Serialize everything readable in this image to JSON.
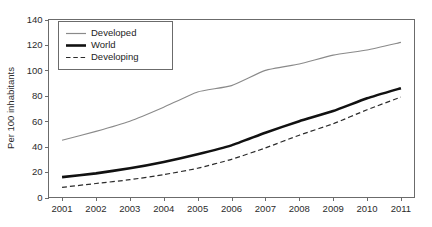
{
  "chart_data": {
    "type": "line",
    "title": "",
    "subtitle": "",
    "xlabel": "",
    "ylabel": "Per 100 inhabitants",
    "x": [
      2001,
      2002,
      2003,
      2004,
      2005,
      2006,
      2007,
      2008,
      2009,
      2010,
      2011
    ],
    "categories": [
      "2001",
      "2002",
      "2003",
      "2004",
      "2005",
      "2006",
      "2007",
      "2008",
      "2009",
      "2010",
      "2011"
    ],
    "xlim": [
      2000.6,
      2011.4
    ],
    "ylim": [
      0,
      140
    ],
    "yticks": [
      0,
      20,
      40,
      60,
      80,
      100,
      120,
      140
    ],
    "yticklabels": [
      "0",
      "20",
      "40",
      "60",
      "80",
      "100",
      "120",
      "140"
    ],
    "xticks": [
      2001,
      2002,
      2003,
      2004,
      2005,
      2006,
      2007,
      2008,
      2009,
      2010,
      2011
    ],
    "xticklabels": [
      "2001",
      "2002",
      "2003",
      "2004",
      "2005",
      "2006",
      "2007",
      "2008",
      "2009",
      "2010",
      "2011"
    ],
    "grid": false,
    "legend_position": "upper-left-inside",
    "series": [
      {
        "name": "Developed",
        "style": "solid-thin",
        "color": "#8a8a8a",
        "values": [
          45,
          52,
          60,
          71,
          83,
          88,
          100,
          105,
          112,
          116,
          122
        ]
      },
      {
        "name": "World",
        "style": "solid-thick",
        "color": "#111111",
        "values": [
          16,
          19,
          23,
          28,
          34,
          41,
          51,
          60,
          68,
          78,
          86
        ]
      },
      {
        "name": "Developing",
        "style": "dashed",
        "color": "#2b2b2b",
        "values": [
          8,
          11,
          14,
          18,
          23,
          30,
          39,
          49,
          58,
          69,
          79
        ]
      }
    ]
  },
  "legend": {
    "entries": [
      {
        "label": "Developed"
      },
      {
        "label": "World"
      },
      {
        "label": "Developing"
      }
    ]
  }
}
